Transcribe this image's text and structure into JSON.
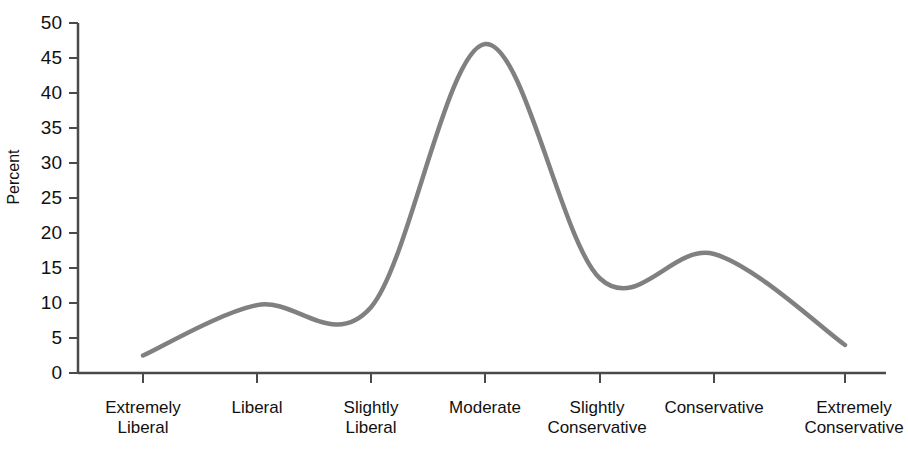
{
  "chart_data": {
    "type": "line",
    "title": "",
    "subtitle": "",
    "xlabel": "",
    "ylabel": "Percent",
    "categories": [
      "Extremely Liberal",
      "Liberal",
      "Slightly Liberal",
      "Moderate",
      "Slightly Conservative",
      "Conservative",
      "Extremely Conservative"
    ],
    "category_lines": [
      [
        "Extremely",
        "Liberal"
      ],
      [
        "Liberal"
      ],
      [
        "Slightly",
        "Liberal"
      ],
      [
        "Moderate"
      ],
      [
        "Slightly",
        "Conservative"
      ],
      [
        "Conservative"
      ],
      [
        "Extremely",
        "Conservative"
      ]
    ],
    "values": [
      2.5,
      9.7,
      9.4,
      47,
      13.5,
      17,
      4
    ],
    "ylim": [
      0,
      50
    ],
    "ytick_labels": [
      "50",
      "45",
      "40",
      "35",
      "30",
      "25",
      "20",
      "15",
      "10",
      "5",
      "0"
    ],
    "ytick_values": [
      50,
      45,
      40,
      35,
      30,
      25,
      20,
      15,
      10,
      5,
      0
    ],
    "grid": false,
    "legend": null,
    "series_color": "#808080",
    "axis_color": "#4a4a4a",
    "smoothing": "spline"
  }
}
